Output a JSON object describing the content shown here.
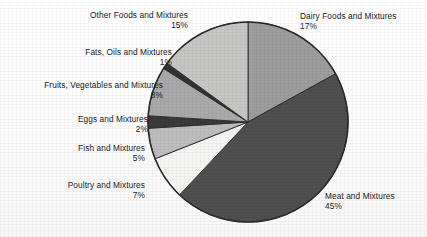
{
  "chart_data": {
    "type": "pie",
    "title": "",
    "subtitle": "",
    "xlabel": "",
    "ylabel": "",
    "legend_position": "none",
    "grid": false,
    "start_angle_deg": 0,
    "direction": "clockwise",
    "units": "percent",
    "total": 100,
    "categories": [
      "Dairy Foods and Mixtures",
      "Meat and Mixtures",
      "Poultry and Mixtures",
      "Fish and Mixtures",
      "Eggs and Mixtures",
      "Fruits, Vegetables and Mixtures",
      "Fats, Oils and Mixtures",
      "Other Foods and Mixtures"
    ],
    "values": [
      17,
      45,
      7,
      5,
      2,
      8,
      1,
      15
    ],
    "slices": [
      {
        "label": "Dairy Foods and Mixtures",
        "pct_text": "17%",
        "value": 17,
        "color": "#9d9d9d"
      },
      {
        "label": "Meat and Mixtures",
        "pct_text": "45%",
        "value": 45,
        "color": "#4f4f4f"
      },
      {
        "label": "Poultry and Mixtures",
        "pct_text": "7%",
        "value": 7,
        "color": "#f5f5f3"
      },
      {
        "label": "Fish and Mixtures",
        "pct_text": "5%",
        "value": 5,
        "color": "#bdbdbd"
      },
      {
        "label": "Eggs and Mixtures",
        "pct_text": "2%",
        "value": 2,
        "color": "#3a3a3a"
      },
      {
        "label": "Fruits, Vegetables and Mixtures",
        "pct_text": "8%",
        "value": 8,
        "color": "#a9a9a9"
      },
      {
        "label": "Fats, Oils and Mixtures",
        "pct_text": "1%",
        "value": 1,
        "color": "#333333"
      },
      {
        "label": "Other Foods and Mixtures",
        "pct_text": "15%",
        "value": 15,
        "color": "#c6c6c4"
      }
    ],
    "outline_color": "#2b2b2b",
    "label_color": "#1b1b1b",
    "background": "#ffffff"
  },
  "labels": {
    "other_foods": {
      "name": "Other Foods and Mixtures",
      "pct": "15%"
    },
    "fats_oils": {
      "name": "Fats, Oils and Mixtures",
      "pct": "1%"
    },
    "fruits_veg": {
      "name": "Fruits, Vegetables and Mixtures",
      "pct": "8%"
    },
    "eggs": {
      "name": "Eggs and Mixtures",
      "pct": "2%"
    },
    "fish": {
      "name": "Fish and Mixtures",
      "pct": "5%"
    },
    "poultry": {
      "name": "Poultry and Mixtures",
      "pct": "7%"
    },
    "dairy": {
      "name": "Dairy Foods and Mixtures",
      "pct": "17%"
    },
    "meat": {
      "name": "Meat and Mixtures",
      "pct": "45%"
    }
  }
}
